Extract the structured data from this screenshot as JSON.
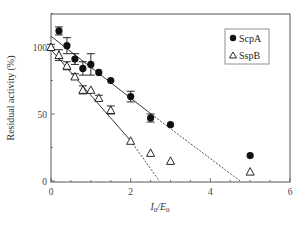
{
  "chart_data": {
    "type": "scatter",
    "title": "",
    "xlabel": "I0/E0",
    "xlabel_main": "I",
    "xlabel_sub1": "0",
    "xlabel_slash": "/E",
    "xlabel_sub2": "0",
    "ylabel": "Residual activity (%)",
    "xlim": [
      0,
      6
    ],
    "ylim": [
      0,
      125
    ],
    "x_ticks": [
      0,
      2,
      4,
      6
    ],
    "x_tick_labels": [
      "0",
      "2",
      "4",
      "6"
    ],
    "y_ticks": [
      0,
      50,
      100
    ],
    "y_tick_labels": [
      "0",
      "50",
      "100"
    ],
    "grid": false,
    "legend_position": "upper right",
    "series": [
      {
        "name": "ScpA",
        "marker": "filled-circle",
        "color": "#111111",
        "x": [
          0.2,
          0.4,
          0.6,
          0.8,
          1.0,
          1.2,
          1.5,
          2.0,
          2.5,
          3.0,
          5.0
        ],
        "y": [
          112,
          101,
          91,
          84,
          87,
          81,
          75,
          63,
          47,
          42,
          19
        ],
        "error": [
          3,
          6,
          4,
          5,
          8,
          0,
          0,
          4,
          3,
          0,
          0
        ],
        "fit_solid": {
          "x": [
            0,
            2.6
          ],
          "y": [
            108,
            48
          ]
        },
        "fit_dashed": {
          "x": [
            2.6,
            4.75
          ],
          "y": [
            48,
            0
          ]
        }
      },
      {
        "name": "SspB",
        "marker": "open-triangle",
        "color": "#111111",
        "x": [
          0,
          0.2,
          0.4,
          0.6,
          0.8,
          1.0,
          1.2,
          1.5,
          2.0,
          2.5,
          3.0,
          5.0
        ],
        "y": [
          100,
          94,
          86,
          78,
          68,
          68,
          62,
          53,
          30,
          21,
          15,
          7
        ],
        "error": [
          2,
          4,
          3,
          2,
          3,
          0,
          2,
          3,
          0,
          0,
          0,
          0
        ],
        "fit_solid": {
          "x": [
            0,
            2.0
          ],
          "y": [
            98,
            30
          ]
        },
        "fit_dashed": {
          "x": [
            2.0,
            2.72
          ],
          "y": [
            30,
            0
          ]
        }
      }
    ]
  },
  "legend": {
    "items": [
      {
        "label": "ScpA",
        "marker": "filled-circle"
      },
      {
        "label": "SspB",
        "marker": "open-triangle"
      }
    ]
  }
}
